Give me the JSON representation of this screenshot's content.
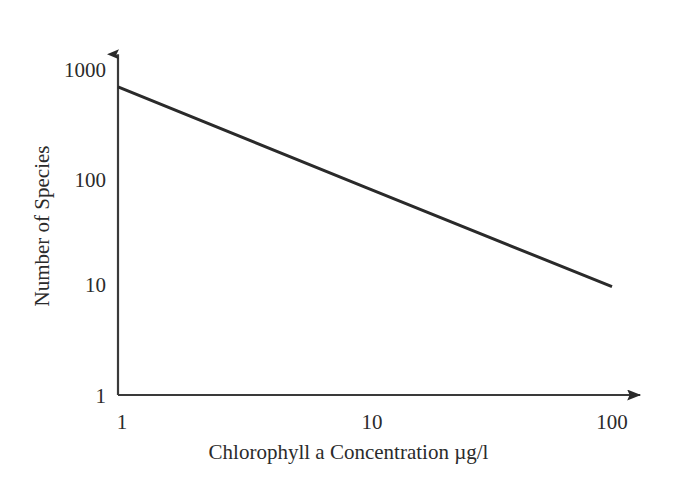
{
  "chart_data": {
    "type": "line",
    "title": "",
    "subtitle": "",
    "xlabel": "Chlorophyll a Concentration µg/l",
    "ylabel": "Number of Species",
    "xscale": "log",
    "yscale": "log",
    "xlim": [
      1,
      130
    ],
    "ylim": [
      1,
      1400
    ],
    "xticks": [
      1,
      10,
      100
    ],
    "xtick_labels": [
      "1",
      "10",
      "100"
    ],
    "yticks": [
      1,
      10,
      100,
      1000
    ],
    "ytick_labels": [
      "1",
      "10",
      "100",
      "1000"
    ],
    "grid": false,
    "legend": false,
    "legend_position": "none",
    "axis_arrows": true,
    "series": [
      {
        "name": "Species richness vs chlorophyll a",
        "x": [
          1,
          10,
          100
        ],
        "y": [
          700,
          83,
          10
        ],
        "color": "#2a2a2a",
        "line_width": 3,
        "marker": "none"
      }
    ],
    "annotations": []
  },
  "axis_labels": {
    "y": {
      "t1000": "1000",
      "t100": "100",
      "t10": "10",
      "t1": "1"
    },
    "x": {
      "t1": "1",
      "t10": "10",
      "t100": "100"
    },
    "x_title": "Chlorophyll a Concentration µg/l",
    "y_title": "Number of Species"
  },
  "colors": {
    "background": "#ffffff",
    "axis": "#3a3a3a",
    "data_line": "#2a2a2a",
    "text": "#2b2b2b"
  }
}
